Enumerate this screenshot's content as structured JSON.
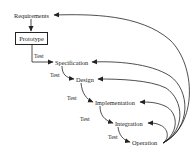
{
  "diagram": {
    "type": "waterfall-with-prototyping",
    "stages": [
      {
        "id": "requirements",
        "label": "Requirements"
      },
      {
        "id": "prototype",
        "label": "Prototype",
        "boxed": true
      },
      {
        "id": "specification",
        "label": "Specification"
      },
      {
        "id": "design",
        "label": "Design"
      },
      {
        "id": "implementation",
        "label": "Implementation"
      },
      {
        "id": "integration",
        "label": "Integration"
      },
      {
        "id": "operation",
        "label": "Operation"
      }
    ],
    "test_labels": [
      "Test",
      "Test",
      "Test",
      "Test",
      "Test"
    ],
    "edges": [
      {
        "from": "requirements",
        "to": "prototype"
      },
      {
        "from": "prototype",
        "to": "specification",
        "label": "Test"
      },
      {
        "from": "specification",
        "to": "design",
        "label": "Test"
      },
      {
        "from": "design",
        "to": "implementation",
        "label": "Test"
      },
      {
        "from": "implementation",
        "to": "integration",
        "label": "Test"
      },
      {
        "from": "integration",
        "to": "operation",
        "label": "Test"
      },
      {
        "from": "operation",
        "to": "requirements",
        "feedback": true
      },
      {
        "from": "operation",
        "to": "specification",
        "feedback": true
      },
      {
        "from": "operation",
        "to": "design",
        "feedback": true
      },
      {
        "from": "operation",
        "to": "implementation",
        "feedback": true
      },
      {
        "from": "operation",
        "to": "integration",
        "feedback": true
      }
    ],
    "colors": {
      "line": "#222222",
      "background": "#ffffff"
    }
  }
}
